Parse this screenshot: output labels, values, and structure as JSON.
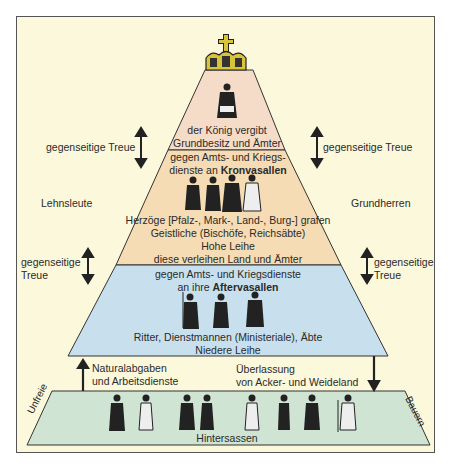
{
  "colors": {
    "frame_bg": "#fcf8dc",
    "tier_king": "#f5dcc8",
    "tier_kronvasallen": "#f5dcb4",
    "tier_aftervasallen": "#c8e0ee",
    "tier_hintersassen": "#cfe4d3",
    "crown": "#d9c33a"
  },
  "pyramid": {
    "crown_icon": "crown",
    "king": {
      "line1": "der König vergibt",
      "line2": "Grundbesitz und Ämter"
    },
    "kronvasallen": {
      "line1": "gegen Amts- und Kriegs-",
      "line2_prefix": "dienste an ",
      "line2_bold": "Kronvasallen",
      "line3": "Herzöge [Pfalz-, Mark-, Land-, Burg-] grafen",
      "line4": "Geistliche (Bischöfe, Reichsäbte)",
      "line5": "Hohe Leihe",
      "line6": "diese verleihen Land und Ämter"
    },
    "aftervasallen": {
      "line1": "gegen Amts- und Kriegsdienste",
      "line2_prefix": "an ihre ",
      "line2_bold": "Aftervasallen",
      "line3": "Ritter, Dienstmannen (Ministeriale), Äbte",
      "line4": "Niedere Leihe"
    },
    "hintersassen": {
      "label": "Hintersassen",
      "left_side": "Unfreie",
      "right_side": "Bauern"
    }
  },
  "side_labels": {
    "treue_top_left": "gegenseitige Treue",
    "treue_top_right": "gegenseitige Treue",
    "lehnsleute": "Lehnsleute",
    "grundherren": "Grundherren",
    "treue_mid_left_1": "gegenseitige",
    "treue_mid_left_2": "Treue",
    "treue_mid_right_1": "gegenseitige",
    "treue_mid_right_2": "Treue",
    "up_arrow_1": "Naturalabgaben",
    "up_arrow_2": "und Arbeitsdienste",
    "down_arrow_1": "Überlassung",
    "down_arrow_2": "von Acker- und Weideland"
  }
}
